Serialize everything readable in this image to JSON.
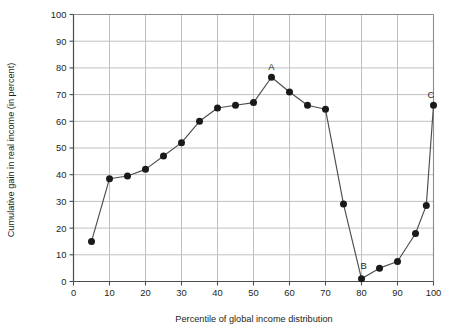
{
  "chart_data": {
    "type": "line",
    "title": "",
    "subtitle": "",
    "xlabel": "Percentile of global income distribution",
    "ylabel": "Cumulative gain in real income (in percent)",
    "xlim": [
      0,
      100
    ],
    "ylim": [
      0,
      100
    ],
    "xticks": [
      0,
      10,
      20,
      30,
      40,
      50,
      60,
      70,
      80,
      90,
      100
    ],
    "ytivks_note": "",
    "yticks": [
      0,
      10,
      20,
      30,
      40,
      50,
      60,
      70,
      80,
      90,
      100
    ],
    "xtick_labels": [
      "0",
      "10",
      "20",
      "30",
      "40",
      "50",
      "60",
      "70",
      "80",
      "90",
      "100"
    ],
    "ytick_labels": [
      "0",
      "10",
      "20",
      "30",
      "40",
      "50",
      "60",
      "70",
      "80",
      "90",
      "100"
    ],
    "grid": true,
    "grid_color": "#b9b9b9",
    "legend": false,
    "legend_position": "none",
    "marker": "filled-circle",
    "marker_color": "#1a1a1a",
    "line_color": "#4d4d4d",
    "x": [
      5,
      10,
      15,
      20,
      25,
      30,
      35,
      40,
      45,
      50,
      55,
      60,
      65,
      70,
      75,
      80,
      85,
      90,
      95,
      98,
      100
    ],
    "values": [
      15,
      38.5,
      39.5,
      42,
      47,
      52,
      60,
      65,
      66,
      67,
      76.5,
      71,
      66,
      64.5,
      29,
      1,
      5,
      7.5,
      18,
      28.5,
      66
    ],
    "annotations": [
      {
        "label": "A",
        "x": 55,
        "y": 76.5,
        "dx": 0,
        "dy": 7
      },
      {
        "label": "B",
        "x": 80,
        "y": 1,
        "dx": 2.2,
        "dy": 10
      },
      {
        "label": "C",
        "x": 100,
        "y": 66,
        "dx": -2.6,
        "dy": 7
      }
    ]
  }
}
